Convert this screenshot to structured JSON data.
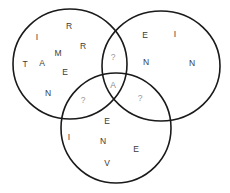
{
  "diagram": {
    "type": "venn-3",
    "circles": [
      {
        "id": "left",
        "cx": 70,
        "cy": 64,
        "rx": 57,
        "ry": 55
      },
      {
        "id": "right",
        "cx": 161,
        "cy": 66,
        "rx": 59,
        "ry": 55
      },
      {
        "id": "bottom",
        "cx": 116,
        "cy": 128,
        "rx": 55,
        "ry": 55
      }
    ],
    "regions": {
      "left_only": [
        {
          "char": "R",
          "x": 69,
          "y": 26
        },
        {
          "char": "I",
          "x": 37,
          "y": 37
        },
        {
          "char": "R",
          "x": 83,
          "y": 46
        },
        {
          "char": "M",
          "x": 58,
          "y": 53
        },
        {
          "char": "T",
          "x": 25,
          "y": 64
        },
        {
          "char": "A",
          "x": 42,
          "y": 63
        },
        {
          "char": "E",
          "x": 65,
          "y": 72
        },
        {
          "char": "N",
          "x": 48,
          "y": 93
        }
      ],
      "right_only": [
        {
          "char": "E",
          "x": 145,
          "y": 35
        },
        {
          "char": "I",
          "x": 175,
          "y": 34
        },
        {
          "char": "N",
          "x": 146,
          "y": 62
        },
        {
          "char": "N",
          "x": 192,
          "y": 63
        }
      ],
      "bottom_only": [
        {
          "char": "E",
          "x": 107,
          "y": 121
        },
        {
          "char": "I",
          "x": 69,
          "y": 137
        },
        {
          "char": "N",
          "x": 103,
          "y": 141
        },
        {
          "char": "E",
          "x": 136,
          "y": 149
        },
        {
          "char": "V",
          "x": 107,
          "y": 163
        }
      ],
      "left_right": {
        "char": "?",
        "x": 113,
        "y": 57
      },
      "left_bottom": {
        "char": "?",
        "x": 83,
        "y": 100
      },
      "right_bottom": {
        "char": "?",
        "x": 140,
        "y": 98
      },
      "all_three": {
        "char": "A",
        "x": 113,
        "y": 85
      }
    }
  }
}
